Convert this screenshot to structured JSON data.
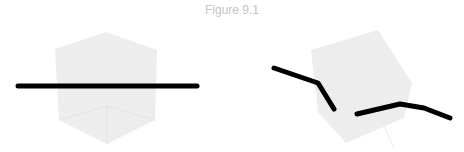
{
  "figure": {
    "title": "Figure 9.1",
    "panels": [
      {
        "name": "left-panel",
        "description": "translucent cube viewed face-on with straight black rod passing through"
      },
      {
        "name": "right-panel",
        "description": "rotated translucent cube with bent black rod passing through"
      }
    ],
    "colors": {
      "cube_fill": "#ececec",
      "cube_edge": "#e2e2e2",
      "rod": "#000000",
      "title": "#c4c4c4"
    }
  }
}
